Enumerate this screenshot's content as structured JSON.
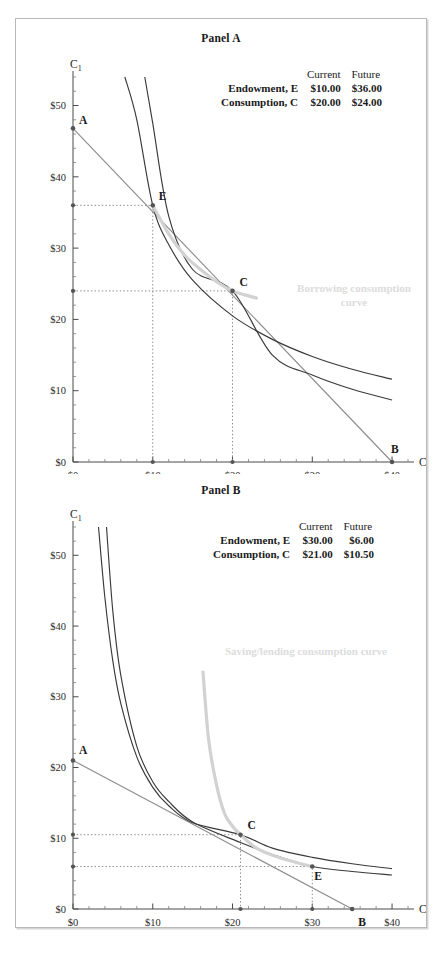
{
  "figure": {
    "panels": [
      {
        "id": "panel-a",
        "title": "Panel A",
        "table": {
          "col_headers": [
            "Current",
            "Future"
          ],
          "rows": [
            {
              "label": "Endowment, E",
              "current": "$10.00",
              "future": "$36.00"
            },
            {
              "label": "Consumption, C",
              "current": "$20.00",
              "future": "$24.00"
            }
          ]
        },
        "annotation": {
          "line1": "Borrowing consumption",
          "line2": "curve"
        },
        "axes": {
          "x_name": "C",
          "x_sub": "0",
          "y_name": "C",
          "y_sub": "1",
          "x_ticks": [
            "$0",
            "$10",
            "$20",
            "$30",
            "$40"
          ],
          "y_ticks": [
            "$0",
            "$10",
            "$20",
            "$30",
            "$40",
            "$50"
          ]
        },
        "points": [
          {
            "label": "A",
            "x": 0,
            "y": 46.8
          },
          {
            "label": "E",
            "x": 10,
            "y": 36.0
          },
          {
            "label": "C",
            "x": 20,
            "y": 24.0
          },
          {
            "label": "B",
            "x": 40,
            "y": 0
          }
        ]
      },
      {
        "id": "panel-b",
        "title": "Panel B",
        "table": {
          "col_headers": [
            "Current",
            "Future"
          ],
          "rows": [
            {
              "label": "Endowment, E",
              "current": "$30.00",
              "future": "$6.00"
            },
            {
              "label": "Consumption, C",
              "current": "$21.00",
              "future": "$10.50"
            }
          ]
        },
        "annotation": {
          "line1": "Saving/lending consumption curve",
          "line2": ""
        },
        "axes": {
          "x_name": "C",
          "x_sub": "0",
          "y_name": "C",
          "y_sub": "1",
          "x_ticks": [
            "$0",
            "$10",
            "$20",
            "$30",
            "$40"
          ],
          "y_ticks": [
            "$0",
            "$10",
            "$20",
            "$30",
            "$40",
            "$50"
          ]
        },
        "points": [
          {
            "label": "A",
            "x": 0,
            "y": 21.0
          },
          {
            "label": "C",
            "x": 21,
            "y": 10.5
          },
          {
            "label": "E",
            "x": 30,
            "y": 6.0
          },
          {
            "label": "B",
            "x": 35,
            "y": 0
          }
        ]
      }
    ]
  },
  "chart_data": [
    {
      "type": "line",
      "title": "Panel A",
      "xlabel": "C0",
      "ylabel": "C1",
      "xlim": [
        0,
        42
      ],
      "ylim": [
        0,
        54
      ],
      "x_ticks": [
        0,
        10,
        20,
        30,
        40
      ],
      "y_ticks": [
        0,
        10,
        20,
        30,
        40,
        50
      ],
      "x_tick_labels": [
        "$0",
        "$10",
        "$20",
        "$30",
        "$40"
      ],
      "y_tick_labels": [
        "$0",
        "$10",
        "$20",
        "$30",
        "$40",
        "$50"
      ],
      "grid": false,
      "legend": "none",
      "endowment": {
        "current": 10.0,
        "future": 36.0
      },
      "consumption": {
        "current": 20.0,
        "future": 24.0
      },
      "series": [
        {
          "name": "Budget line (A to B)",
          "type": "line",
          "color": "#8d8d8d",
          "x": [
            0,
            40
          ],
          "values": [
            46.8,
            0
          ]
        },
        {
          "name": "Indifference curve through E",
          "type": "curve",
          "color": "#3a3a3a",
          "x": [
            6.5,
            8,
            10,
            12,
            15,
            20,
            25,
            30,
            35,
            40
          ],
          "values": [
            54,
            48,
            36,
            30.5,
            25.5,
            20.5,
            17.2,
            14.8,
            13.0,
            11.6
          ]
        },
        {
          "name": "Indifference curve through C",
          "type": "curve",
          "color": "#3a3a3a",
          "x": [
            9,
            10,
            12,
            15,
            20,
            25,
            30,
            35,
            40
          ],
          "values": [
            54,
            47.5,
            34.5,
            27.0,
            24.0,
            15.0,
            12.2,
            10.2,
            8.7
          ]
        },
        {
          "name": "Borrowing consumption curve",
          "type": "curve",
          "color": "#d2d2d2",
          "x": [
            10,
            12,
            14,
            16,
            18,
            20,
            22,
            23
          ],
          "values": [
            36.0,
            32.0,
            29.0,
            27.0,
            25.3,
            24.0,
            23.3,
            23.0
          ]
        }
      ],
      "annotations": [
        {
          "text": "Borrowing consumption curve",
          "x": 28,
          "y": 24,
          "color": "#dcdcdc"
        },
        {
          "text": "A",
          "x": 0,
          "y": 46.8
        },
        {
          "text": "E",
          "x": 10,
          "y": 36.0
        },
        {
          "text": "C",
          "x": 20,
          "y": 24.0
        },
        {
          "text": "B",
          "x": 40,
          "y": 0
        }
      ]
    },
    {
      "type": "line",
      "title": "Panel B",
      "xlabel": "C0",
      "ylabel": "C1",
      "xlim": [
        0,
        42
      ],
      "ylim": [
        0,
        54
      ],
      "x_ticks": [
        0,
        10,
        20,
        30,
        40
      ],
      "y_ticks": [
        0,
        10,
        20,
        30,
        40,
        50
      ],
      "x_tick_labels": [
        "$0",
        "$10",
        "$20",
        "$30",
        "$40"
      ],
      "y_tick_labels": [
        "$0",
        "$10",
        "$20",
        "$30",
        "$40",
        "$50"
      ],
      "grid": false,
      "legend": "none",
      "endowment": {
        "current": 30.0,
        "future": 6.0
      },
      "consumption": {
        "current": 21.0,
        "future": 10.5
      },
      "series": [
        {
          "name": "Budget line (A to B)",
          "type": "line",
          "color": "#8d8d8d",
          "x": [
            0,
            35
          ],
          "values": [
            21.0,
            0
          ]
        },
        {
          "name": "Indifference curve through C",
          "type": "curve",
          "color": "#3a3a3a",
          "x": [
            3.2,
            4,
            5,
            6,
            8,
            10,
            12,
            15,
            21,
            25,
            30,
            35,
            40
          ],
          "values": [
            54,
            44,
            35,
            29,
            21.5,
            17.2,
            14.6,
            12.2,
            10.5,
            8.6,
            7.3,
            6.4,
            5.7
          ]
        },
        {
          "name": "Indifference curve through E",
          "type": "curve",
          "color": "#3a3a3a",
          "x": [
            4.2,
            5,
            6,
            8,
            10,
            12,
            15,
            21,
            25,
            30,
            35,
            40
          ],
          "values": [
            54,
            42,
            33,
            23,
            18.0,
            15.2,
            12.3,
            9.4,
            7.7,
            6.0,
            5.3,
            4.8
          ]
        },
        {
          "name": "Saving/lending consumption curve",
          "type": "curve",
          "color": "#d2d2d2",
          "x": [
            16.3,
            17,
            18,
            19,
            20,
            21,
            23,
            26,
            30
          ],
          "values": [
            33.5,
            24,
            17.5,
            13.5,
            11.7,
            10.5,
            8.6,
            7.2,
            6.0
          ]
        }
      ],
      "annotations": [
        {
          "text": "Saving/lending consumption curve",
          "x": 25,
          "y": 34,
          "color": "#dcdcdc"
        },
        {
          "text": "A",
          "x": 0,
          "y": 21.0
        },
        {
          "text": "C",
          "x": 21,
          "y": 10.5
        },
        {
          "text": "E",
          "x": 30,
          "y": 6.0
        },
        {
          "text": "B",
          "x": 35,
          "y": 0
        }
      ]
    }
  ]
}
